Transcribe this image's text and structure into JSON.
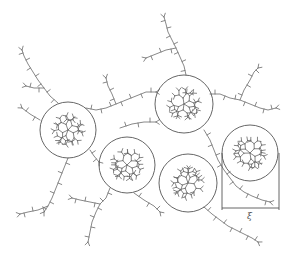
{
  "figure": {
    "dimension_label": "ξ",
    "colors": {
      "stroke": "#555555",
      "chain": "#6a6a6a",
      "background": "#ffffff"
    }
  },
  "blobs": [
    {
      "id": "blob-left",
      "cx": 68,
      "cy": 130,
      "r": 28
    },
    {
      "id": "blob-top",
      "cx": 184,
      "cy": 104,
      "r": 29
    },
    {
      "id": "blob-center",
      "cx": 127,
      "cy": 165,
      "r": 28
    },
    {
      "id": "blob-bottom",
      "cx": 188,
      "cy": 183,
      "r": 29
    },
    {
      "id": "blob-right",
      "cx": 250,
      "cy": 153,
      "r": 28
    }
  ],
  "dimension": {
    "x1": 222,
    "x2": 279,
    "y_top": 153,
    "y_line": 208,
    "label_x": 247,
    "label_y": 211
  },
  "chains": [
    {
      "id": "chain-upper-left",
      "points": [
        [
          58,
          103
        ],
        [
          50,
          96
        ],
        [
          44,
          88
        ],
        [
          38,
          80
        ],
        [
          33,
          72
        ],
        [
          28,
          64
        ],
        [
          24,
          56
        ],
        [
          22,
          50
        ]
      ],
      "side": [
        [
          44,
          88
        ],
        [
          34,
          88
        ],
        [
          26,
          86
        ]
      ]
    },
    {
      "id": "chain-top-link",
      "points": [
        [
          86,
          108
        ],
        [
          96,
          110
        ],
        [
          106,
          108
        ],
        [
          116,
          104
        ],
        [
          126,
          100
        ],
        [
          136,
          96
        ],
        [
          146,
          92
        ],
        [
          156,
          92
        ]
      ],
      "side": [
        [
          116,
          104
        ],
        [
          112,
          94
        ],
        [
          108,
          86
        ],
        [
          106,
          78
        ]
      ]
    },
    {
      "id": "chain-top-up",
      "points": [
        [
          186,
          75
        ],
        [
          184,
          66
        ],
        [
          180,
          57
        ],
        [
          176,
          48
        ],
        [
          172,
          40
        ],
        [
          168,
          32
        ],
        [
          166,
          24
        ],
        [
          164,
          17
        ]
      ],
      "side": [
        [
          176,
          48
        ],
        [
          166,
          50
        ],
        [
          156,
          54
        ],
        [
          146,
          58
        ]
      ]
    },
    {
      "id": "chain-top-right",
      "points": [
        [
          210,
          94
        ],
        [
          220,
          94
        ],
        [
          230,
          98
        ],
        [
          240,
          100
        ],
        [
          250,
          104
        ],
        [
          260,
          108
        ],
        [
          268,
          110
        ],
        [
          276,
          108
        ]
      ],
      "side": [
        [
          240,
          100
        ],
        [
          244,
          90
        ],
        [
          250,
          80
        ],
        [
          254,
          72
        ],
        [
          258,
          68
        ]
      ]
    },
    {
      "id": "chain-left-down",
      "points": [
        [
          68,
          158
        ],
        [
          64,
          168
        ],
        [
          60,
          178
        ],
        [
          56,
          188
        ],
        [
          52,
          198
        ],
        [
          48,
          206
        ],
        [
          44,
          212
        ]
      ],
      "side": [
        [
          48,
          206
        ],
        [
          38,
          210
        ],
        [
          28,
          212
        ],
        [
          20,
          214
        ]
      ]
    },
    {
      "id": "chain-left-center",
      "points": [
        [
          90,
          150
        ],
        [
          94,
          156
        ],
        [
          99,
          162
        ]
      ]
    },
    {
      "id": "chain-center-down",
      "points": [
        [
          110,
          188
        ],
        [
          106,
          198
        ],
        [
          100,
          204
        ],
        [
          96,
          212
        ],
        [
          92,
          222
        ],
        [
          90,
          232
        ],
        [
          88,
          242
        ]
      ],
      "side": [
        [
          100,
          204
        ],
        [
          90,
          202
        ],
        [
          80,
          200
        ],
        [
          72,
          198
        ]
      ]
    },
    {
      "id": "chain-center-bottom",
      "points": [
        [
          134,
          193
        ],
        [
          144,
          200
        ],
        [
          154,
          206
        ],
        [
          160,
          212
        ]
      ]
    },
    {
      "id": "chain-top-bottom",
      "points": [
        [
          204,
          130
        ],
        [
          210,
          140
        ],
        [
          214,
          150
        ],
        [
          218,
          160
        ],
        [
          224,
          170
        ],
        [
          230,
          178
        ],
        [
          236,
          186
        ],
        [
          244,
          192
        ],
        [
          252,
          196
        ],
        [
          262,
          200
        ],
        [
          270,
          202
        ]
      ]
    },
    {
      "id": "chain-bottom-right",
      "points": [
        [
          204,
          207
        ],
        [
          212,
          214
        ],
        [
          220,
          220
        ],
        [
          228,
          226
        ],
        [
          236,
          230
        ],
        [
          244,
          234
        ],
        [
          252,
          238
        ],
        [
          258,
          242
        ]
      ]
    },
    {
      "id": "chain-left-top",
      "points": [
        [
          40,
          120
        ],
        [
          30,
          114
        ],
        [
          22,
          108
        ]
      ]
    },
    {
      "id": "chain-mid-left",
      "points": [
        [
          120,
          128
        ],
        [
          132,
          124
        ],
        [
          144,
          122
        ],
        [
          156,
          122
        ]
      ]
    }
  ]
}
